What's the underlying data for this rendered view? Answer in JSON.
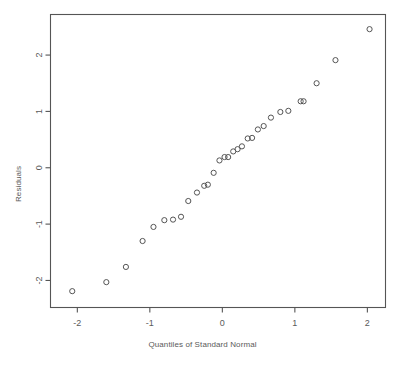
{
  "chart_data": {
    "type": "scatter",
    "title": "",
    "subtitle": "",
    "xlabel": "Quantiles of Standard Normal",
    "ylabel": "Residuals",
    "xlim": [
      -2.37,
      2.25
    ],
    "ylim": [
      -2.48,
      2.72
    ],
    "xticks": [
      -2,
      -1,
      0,
      1,
      2
    ],
    "xticklabels": [
      "-2",
      "-1",
      "0",
      "1",
      "2"
    ],
    "yticks": [
      -2,
      -1,
      0,
      1,
      2
    ],
    "yticklabels": [
      "-2",
      "-1",
      "0",
      "1",
      "2"
    ],
    "grid": false,
    "legend": null,
    "marker": "open-circle",
    "marker_color": "#555555",
    "frame_color": "#555555",
    "background": "#ffffff",
    "series": [
      {
        "name": "residuals",
        "x": [
          -2.07,
          -1.6,
          -1.33,
          -1.1,
          -0.95,
          -0.8,
          -0.68,
          -0.57,
          -0.47,
          -0.35,
          -0.25,
          -0.2,
          -0.12,
          -0.04,
          0.03,
          0.08,
          0.15,
          0.21,
          0.27,
          0.35,
          0.41,
          0.49,
          0.57,
          0.67,
          0.8,
          0.91,
          1.08,
          1.12,
          1.3,
          1.56,
          2.03
        ],
        "y": [
          -2.19,
          -2.03,
          -1.76,
          -1.3,
          -1.05,
          -0.93,
          -0.92,
          -0.87,
          -0.59,
          -0.44,
          -0.32,
          -0.3,
          -0.09,
          0.13,
          0.19,
          0.19,
          0.29,
          0.33,
          0.38,
          0.52,
          0.53,
          0.68,
          0.74,
          0.89,
          0.99,
          1.01,
          1.18,
          1.18,
          1.5,
          1.91,
          2.46
        ]
      }
    ]
  }
}
